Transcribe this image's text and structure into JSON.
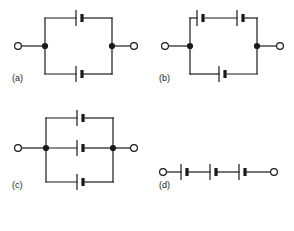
{
  "figure": {
    "type": "circuit-diagram-set",
    "background_color": "#ffffff",
    "line_color": "#1a1a1a",
    "panel_count": 4
  },
  "symbols": {
    "cell": {
      "name": "battery-cell",
      "long_plate": "thin tall vertical line (positive terminal)",
      "short_plate": "thick short vertical line (negative terminal)"
    },
    "terminal": {
      "name": "open-terminal",
      "shape": "open circle"
    },
    "junction": {
      "name": "junction-node",
      "shape": "filled dot"
    }
  },
  "panels": [
    {
      "id": "a",
      "label": "(a)",
      "topology": "two parallel branches",
      "branches": [
        {
          "position": "top",
          "cells": 1
        },
        {
          "position": "bottom",
          "cells": 1
        }
      ],
      "terminals": 2,
      "junctions": 2
    },
    {
      "id": "b",
      "label": "(b)",
      "topology": "two parallel branches, top branch has two cells in series",
      "branches": [
        {
          "position": "top",
          "cells": 2
        },
        {
          "position": "bottom",
          "cells": 1
        }
      ],
      "terminals": 2,
      "junctions": 2
    },
    {
      "id": "c",
      "label": "(c)",
      "topology": "three parallel branches",
      "branches": [
        {
          "position": "top",
          "cells": 1
        },
        {
          "position": "middle",
          "cells": 1
        },
        {
          "position": "bottom",
          "cells": 1
        }
      ],
      "terminals": 2,
      "junctions": 2
    },
    {
      "id": "d",
      "label": "(d)",
      "topology": "single series string",
      "branches": [
        {
          "position": "middle",
          "cells": 3
        }
      ],
      "terminals": 2,
      "junctions": 0
    }
  ]
}
